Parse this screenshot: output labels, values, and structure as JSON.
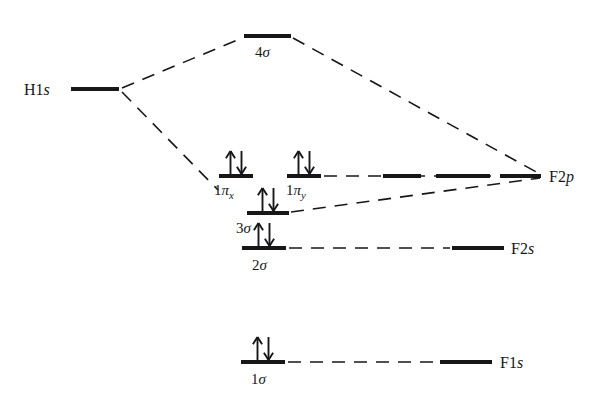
{
  "figure": {
    "kind": "molecular-orbital-energy-level-diagram",
    "molecule": "HF",
    "background_color": "#ffffff",
    "line_color": "#17171a",
    "text_color": "#17171a"
  },
  "atomic_orbitals": {
    "left": [
      {
        "id": "h1s",
        "label_main": "H1",
        "label_italic": "s",
        "label_full": "H1s",
        "bar": {
          "x1": 71,
          "x2": 119,
          "y": 89
        },
        "label_pos": {
          "x": 24,
          "y": 95
        }
      }
    ],
    "right": [
      {
        "id": "f2p",
        "label_main": "F2",
        "label_italic": "p",
        "label_full": "F2p",
        "bars": [
          {
            "x1": 383,
            "x2": 421,
            "y": 176
          },
          {
            "x1": 436,
            "x2": 490,
            "y": 176
          },
          {
            "x1": 500,
            "x2": 541,
            "y": 176
          }
        ],
        "label_pos": {
          "x": 549,
          "y": 182
        }
      },
      {
        "id": "f2s",
        "label_main": "F2",
        "label_italic": "s",
        "label_full": "F2s",
        "bars": [
          {
            "x1": 452,
            "x2": 504,
            "y": 248
          }
        ],
        "label_pos": {
          "x": 511,
          "y": 254
        }
      },
      {
        "id": "f1s",
        "label_main": "F1",
        "label_italic": "s",
        "label_full": "F1s",
        "bars": [
          {
            "x1": 440,
            "x2": 492,
            "y": 362
          }
        ],
        "label_pos": {
          "x": 500,
          "y": 368
        }
      }
    ]
  },
  "molecular_orbitals": [
    {
      "id": "4sigma",
      "label_main": "4",
      "label_greek": "σ",
      "label_full": "4σ",
      "bar": {
        "x1": 244,
        "x2": 291,
        "y": 36
      },
      "label_pos": {
        "x": 255,
        "y": 57
      },
      "electrons": 0,
      "electron_spins": []
    },
    {
      "id": "1pix",
      "label_main": "1",
      "label_greek": "π",
      "label_sub": "x",
      "label_full": "1πx",
      "bar": {
        "x1": 219,
        "x2": 253,
        "y": 176
      },
      "label_pos": {
        "x": 214,
        "y": 195
      },
      "electrons": 2,
      "electron_spins": [
        "up",
        "down"
      ]
    },
    {
      "id": "1piy",
      "label_main": "1",
      "label_greek": "π",
      "label_sub": "y",
      "label_full": "1πy",
      "bar": {
        "x1": 287,
        "x2": 321,
        "y": 176
      },
      "label_pos": {
        "x": 286,
        "y": 195
      },
      "electrons": 2,
      "electron_spins": [
        "up",
        "down"
      ]
    },
    {
      "id": "3sigma",
      "label_main": "3",
      "label_greek": "σ",
      "label_full": "3σ",
      "bar": {
        "x1": 247,
        "x2": 289,
        "y": 213
      },
      "label_pos": {
        "x": 236,
        "y": 233
      },
      "electrons": 2,
      "electron_spins": [
        "up",
        "down"
      ]
    },
    {
      "id": "2sigma",
      "label_main": "2",
      "label_greek": "σ",
      "label_full": "2σ",
      "bar": {
        "x1": 242,
        "x2": 286,
        "y": 248
      },
      "label_pos": {
        "x": 252,
        "y": 270
      },
      "electrons": 2,
      "electron_spins": [
        "up",
        "down"
      ]
    },
    {
      "id": "1sigma",
      "label_main": "1",
      "label_greek": "σ",
      "label_full": "1σ",
      "bar": {
        "x1": 241,
        "x2": 285,
        "y": 362
      },
      "label_pos": {
        "x": 251,
        "y": 384
      },
      "electrons": 2,
      "electron_spins": [
        "up",
        "down"
      ]
    }
  ],
  "correlation_lines": [
    {
      "id": "h1s-to-4sigma",
      "from": "h1s",
      "to": "4sigma",
      "x1": 122,
      "y1": 88,
      "x2": 242,
      "y2": 38
    },
    {
      "id": "h1s-to-1pix",
      "from": "h1s",
      "to": "1pix",
      "x1": 122,
      "y1": 92,
      "x2": 218,
      "y2": 190
    },
    {
      "id": "4sigma-to-f2p",
      "from": "4sigma",
      "to": "f2p",
      "x1": 293,
      "y1": 38,
      "x2": 540,
      "y2": 174
    },
    {
      "id": "3sigma-to-f2p",
      "from": "3sigma",
      "to": "f2p",
      "x1": 291,
      "y1": 212,
      "x2": 540,
      "y2": 178
    },
    {
      "id": "1piy-to-f2p",
      "from": "1piy",
      "to": "f2p",
      "x1": 324,
      "y1": 176,
      "x2": 540,
      "y2": 176
    },
    {
      "id": "2sigma-to-f2s",
      "from": "2sigma",
      "to": "f2s",
      "x1": 289,
      "y1": 248,
      "x2": 450,
      "y2": 248
    },
    {
      "id": "1sigma-to-f1s",
      "from": "1sigma",
      "to": "f1s",
      "x1": 288,
      "y1": 362,
      "x2": 438,
      "y2": 362
    }
  ],
  "styles": {
    "bar_thickness_mo": 4,
    "bar_thickness_ao": 4,
    "dash_pattern": "13 9",
    "dash_width": 1.6,
    "arrow_height": 23,
    "label_font_size": 15,
    "ao_font_size": 16
  }
}
